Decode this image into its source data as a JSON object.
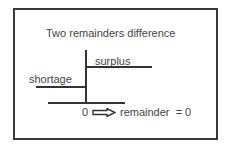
{
  "diagram": {
    "title": "Two remainders difference",
    "labels": {
      "surplus": "surplus",
      "shortage": "shortage",
      "zero": "0",
      "result": "remainder  = 0"
    },
    "icons": {
      "arrow": "hollow-right-arrow"
    },
    "colors": {
      "line": "#333333",
      "text": "#444444",
      "border": "#3a3a3a",
      "background": "#ffffff"
    }
  }
}
